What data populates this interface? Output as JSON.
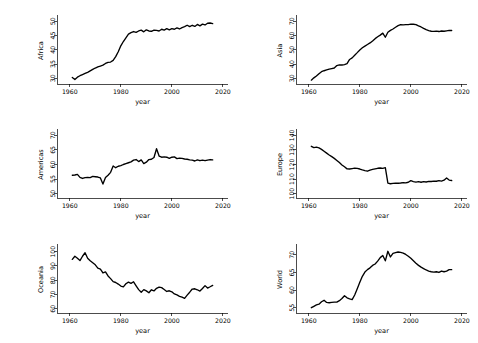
{
  "figure": {
    "layout": "2 columns x 3 rows small-multiples",
    "background_color": "#ffffff",
    "line_color": "#000000",
    "panel_order": [
      "Africa",
      "Asia",
      "Americas",
      "Europe",
      "Oceania",
      "World"
    ]
  },
  "chart_data": [
    {
      "type": "line",
      "title": "",
      "xlabel": "year",
      "ylabel": "Africa",
      "xlim": [
        1955,
        2022
      ],
      "ylim": [
        28.0,
        51.5
      ],
      "xticks": [
        1960,
        1980,
        2000,
        2020
      ],
      "yticks": [
        30,
        35,
        40,
        45,
        50
      ],
      "grid": false,
      "legend": "none",
      "x": [
        1961,
        1962,
        1963,
        1964,
        1965,
        1966,
        1967,
        1968,
        1969,
        1970,
        1971,
        1972,
        1973,
        1974,
        1975,
        1976,
        1977,
        1978,
        1979,
        1980,
        1981,
        1982,
        1983,
        1984,
        1985,
        1986,
        1987,
        1988,
        1989,
        1990,
        1991,
        1992,
        1993,
        1994,
        1995,
        1996,
        1997,
        1998,
        1999,
        2000,
        2001,
        2002,
        2003,
        2004,
        2005,
        2006,
        2007,
        2008,
        2009,
        2010,
        2011,
        2012,
        2013,
        2014,
        2015,
        2016
      ],
      "values": [
        30.3,
        29.6,
        30.4,
        30.9,
        31.3,
        31.7,
        32.1,
        32.6,
        33.1,
        33.6,
        34.0,
        34.3,
        34.6,
        35.2,
        35.6,
        35.7,
        36.3,
        37.6,
        39.3,
        41.4,
        42.9,
        44.2,
        45.5,
        46.0,
        46.4,
        46.1,
        46.6,
        46.9,
        46.3,
        47.0,
        46.6,
        46.5,
        46.9,
        46.8,
        46.6,
        47.2,
        46.9,
        47.4,
        47.0,
        47.4,
        47.2,
        47.7,
        47.3,
        47.8,
        48.1,
        48.6,
        48.1,
        48.6,
        48.2,
        48.9,
        48.4,
        49.0,
        48.7,
        49.3,
        49.4,
        49.2
      ]
    },
    {
      "type": "line",
      "title": "",
      "xlabel": "year",
      "ylabel": "Asia",
      "xlim": [
        1955,
        2022
      ],
      "ylim": [
        26.0,
        73.0
      ],
      "xticks": [
        1960,
        1980,
        2000,
        2020
      ],
      "yticks": [
        30,
        40,
        50,
        60,
        70
      ],
      "grid": false,
      "legend": "none",
      "x": [
        1961,
        1962,
        1963,
        1964,
        1965,
        1966,
        1967,
        1968,
        1969,
        1970,
        1971,
        1972,
        1973,
        1974,
        1975,
        1976,
        1977,
        1978,
        1979,
        1980,
        1981,
        1982,
        1983,
        1984,
        1985,
        1986,
        1987,
        1988,
        1989,
        1990,
        1991,
        1992,
        1993,
        1994,
        1995,
        1996,
        1997,
        1998,
        1999,
        2000,
        2001,
        2002,
        2003,
        2004,
        2005,
        2006,
        2007,
        2008,
        2009,
        2010,
        2011,
        2012,
        2013,
        2014,
        2015,
        2016
      ],
      "values": [
        28.7,
        30.3,
        31.6,
        33.2,
        34.6,
        35.3,
        35.9,
        36.4,
        36.8,
        37.2,
        38.9,
        39.4,
        39.3,
        39.6,
        40.3,
        43.2,
        44.3,
        46.2,
        48.0,
        49.9,
        51.4,
        52.6,
        53.7,
        54.8,
        56.2,
        57.8,
        59.1,
        60.3,
        61.7,
        58.8,
        62.3,
        63.6,
        64.6,
        65.8,
        66.9,
        67.6,
        67.5,
        67.6,
        67.7,
        68.0,
        67.9,
        67.7,
        66.8,
        66.0,
        65.0,
        64.1,
        63.5,
        63.0,
        62.9,
        63.1,
        62.8,
        63.2,
        63.0,
        63.3,
        63.6,
        63.5
      ]
    },
    {
      "type": "line",
      "title": "",
      "xlabel": "year",
      "ylabel": "Americas",
      "xlim": [
        1955,
        2022
      ],
      "ylim": [
        48.5,
        71.5
      ],
      "xticks": [
        1960,
        1980,
        2000,
        2020
      ],
      "yticks": [
        50,
        55,
        60,
        65,
        70
      ],
      "grid": false,
      "legend": "none",
      "x": [
        1961,
        1962,
        1963,
        1964,
        1965,
        1966,
        1967,
        1968,
        1969,
        1970,
        1971,
        1972,
        1973,
        1974,
        1975,
        1976,
        1977,
        1978,
        1979,
        1980,
        1981,
        1982,
        1983,
        1984,
        1985,
        1986,
        1987,
        1988,
        1989,
        1990,
        1991,
        1992,
        1993,
        1994,
        1995,
        1996,
        1997,
        1998,
        1999,
        2000,
        2001,
        2002,
        2003,
        2004,
        2005,
        2006,
        2007,
        2008,
        2009,
        2010,
        2011,
        2012,
        2013,
        2014,
        2015,
        2016
      ],
      "values": [
        56.3,
        56.4,
        56.6,
        55.6,
        55.2,
        55.5,
        55.6,
        55.5,
        55.9,
        55.8,
        55.7,
        55.4,
        53.3,
        55.5,
        56.3,
        57.3,
        59.5,
        58.9,
        59.4,
        59.6,
        60.0,
        60.3,
        60.6,
        60.9,
        61.5,
        61.7,
        61.0,
        61.6,
        60.3,
        60.8,
        61.7,
        61.8,
        62.4,
        65.4,
        62.9,
        62.5,
        62.6,
        62.5,
        62.1,
        62.5,
        62.6,
        62.0,
        62.2,
        62.1,
        61.9,
        61.8,
        61.6,
        61.5,
        61.2,
        61.6,
        61.3,
        61.5,
        61.3,
        61.5,
        61.7,
        61.6
      ]
    },
    {
      "type": "line",
      "title": "",
      "xlabel": "year",
      "ylabel": "Europe",
      "xlim": [
        1955,
        2022
      ],
      "ylim": [
        97.0,
        143.0
      ],
      "xticks": [
        1960,
        1980,
        2000,
        2020
      ],
      "yticks": [
        100,
        110,
        120,
        130,
        140
      ],
      "grid": false,
      "legend": "none",
      "x": [
        1961,
        1962,
        1963,
        1964,
        1965,
        1966,
        1967,
        1968,
        1969,
        1970,
        1971,
        1972,
        1973,
        1974,
        1975,
        1976,
        1977,
        1978,
        1979,
        1980,
        1981,
        1982,
        1983,
        1984,
        1985,
        1986,
        1987,
        1988,
        1989,
        1990,
        1991,
        1992,
        1993,
        1994,
        1995,
        1996,
        1997,
        1998,
        1999,
        2000,
        2001,
        2002,
        2003,
        2004,
        2005,
        2006,
        2007,
        2008,
        2009,
        2010,
        2011,
        2012,
        2013,
        2014,
        2015,
        2016
      ],
      "values": [
        132.5,
        131.6,
        131.9,
        131.4,
        130.4,
        129.1,
        127.8,
        126.5,
        125.4,
        124.2,
        122.8,
        121.3,
        119.7,
        118.4,
        117.0,
        116.9,
        117.2,
        117.5,
        117.3,
        116.9,
        116.3,
        115.8,
        115.4,
        116.1,
        116.6,
        117.0,
        117.4,
        117.6,
        117.3,
        117.8,
        107.2,
        106.8,
        107.0,
        107.2,
        107.1,
        107.3,
        107.6,
        107.4,
        107.8,
        108.9,
        108.3,
        107.9,
        108.2,
        107.8,
        108.2,
        108.0,
        108.4,
        108.3,
        108.6,
        108.5,
        108.9,
        108.6,
        109.2,
        110.7,
        109.3,
        109.0
      ]
    },
    {
      "type": "line",
      "title": "",
      "xlabel": "year",
      "ylabel": "Oceania",
      "xlim": [
        1955,
        2022
      ],
      "ylim": [
        57.0,
        104.0
      ],
      "xticks": [
        1960,
        1980,
        2000,
        2020
      ],
      "yticks": [
        60,
        70,
        80,
        90,
        100
      ],
      "grid": false,
      "legend": "none",
      "x": [
        1961,
        1962,
        1963,
        1964,
        1965,
        1966,
        1967,
        1968,
        1969,
        1970,
        1971,
        1972,
        1973,
        1974,
        1975,
        1976,
        1977,
        1978,
        1979,
        1980,
        1981,
        1982,
        1983,
        1984,
        1985,
        1986,
        1987,
        1988,
        1989,
        1990,
        1991,
        1992,
        1993,
        1994,
        1995,
        1996,
        1997,
        1998,
        1999,
        2000,
        2001,
        2002,
        2003,
        2004,
        2005,
        2006,
        2007,
        2008,
        2009,
        2010,
        2011,
        2012,
        2013,
        2014,
        2015,
        2016
      ],
      "values": [
        94.6,
        96.8,
        95.4,
        93.8,
        96.8,
        99.3,
        95.4,
        93.6,
        92.2,
        90.8,
        88.5,
        87.8,
        85.1,
        85.8,
        83.0,
        81.1,
        79.0,
        78.4,
        77.3,
        75.9,
        75.3,
        77.5,
        78.7,
        77.8,
        78.9,
        76.1,
        73.4,
        71.6,
        73.4,
        72.5,
        71.2,
        73.3,
        72.5,
        74.3,
        75.2,
        74.8,
        73.5,
        72.1,
        72.6,
        71.9,
        70.4,
        69.7,
        68.7,
        68.1,
        67.3,
        69.5,
        71.6,
        73.8,
        74.0,
        73.3,
        72.4,
        74.2,
        76.2,
        74.5,
        75.4,
        76.4
      ]
    },
    {
      "type": "line",
      "title": "",
      "xlabel": "year",
      "ylabel": "World",
      "xlim": [
        1955,
        2022
      ],
      "ylim": [
        53.5,
        72.5
      ],
      "xticks": [
        1960,
        1980,
        2000,
        2020
      ],
      "yticks": [
        55,
        60,
        65,
        70
      ],
      "grid": false,
      "legend": "none",
      "x": [
        1961,
        1962,
        1963,
        1964,
        1965,
        1966,
        1967,
        1968,
        1969,
        1970,
        1971,
        1972,
        1973,
        1974,
        1975,
        1976,
        1977,
        1978,
        1979,
        1980,
        1981,
        1982,
        1983,
        1984,
        1985,
        1986,
        1987,
        1988,
        1989,
        1990,
        1991,
        1992,
        1993,
        1994,
        1995,
        1996,
        1997,
        1998,
        1999,
        2000,
        2001,
        2002,
        2003,
        2004,
        2005,
        2006,
        2007,
        2008,
        2009,
        2010,
        2011,
        2012,
        2013,
        2014,
        2015,
        2016
      ],
      "values": [
        55.0,
        55.4,
        55.8,
        56.0,
        56.7,
        57.1,
        56.5,
        56.4,
        56.5,
        56.6,
        56.6,
        57.0,
        57.6,
        58.4,
        57.8,
        57.5,
        57.3,
        58.6,
        60.4,
        62.2,
        63.9,
        65.1,
        65.8,
        66.3,
        67.0,
        67.4,
        68.2,
        69.2,
        69.8,
        68.3,
        71.0,
        69.4,
        70.4,
        70.6,
        70.8,
        70.7,
        70.5,
        70.1,
        69.6,
        69.0,
        68.3,
        67.6,
        67.0,
        66.5,
        66.1,
        65.7,
        65.4,
        65.2,
        65.1,
        65.2,
        65.0,
        65.4,
        65.2,
        65.4,
        65.8,
        65.8
      ]
    }
  ]
}
